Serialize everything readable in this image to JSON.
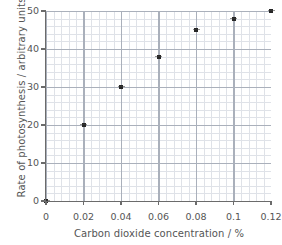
{
  "chart_data": {
    "type": "scatter",
    "title": "",
    "xlabel": "Carbon dioxide concentration / %",
    "ylabel": "Rate of photosynthesis / arbitrary units",
    "xlim": [
      0,
      0.12
    ],
    "ylim": [
      0,
      50
    ],
    "xticks": [
      "0",
      "0.02",
      "0.04",
      "0.06",
      "0.08",
      "0.1",
      "0.12"
    ],
    "xtick_values": [
      0,
      0.02,
      0.04,
      0.06,
      0.08,
      0.1,
      0.12
    ],
    "yticks": [
      "0",
      "10",
      "20",
      "30",
      "40",
      "50"
    ],
    "ytick_values": [
      0,
      10,
      20,
      30,
      40,
      50
    ],
    "grid": true,
    "grid_minor": true,
    "legend": "none",
    "marker": "square-cross",
    "marker_color": "#262626",
    "grid_major_color": "#aab0bb",
    "grid_minor_color": "#dfe2e8",
    "axis_color": "#6b6b6b",
    "text_color": "#555555",
    "x": [
      0,
      0.02,
      0.04,
      0.06,
      0.08,
      0.1,
      0.12
    ],
    "values": [
      0,
      20,
      30,
      38,
      45,
      48,
      50
    ],
    "points": [
      {
        "x": 0,
        "y": 0
      },
      {
        "x": 0.02,
        "y": 20
      },
      {
        "x": 0.04,
        "y": 30
      },
      {
        "x": 0.06,
        "y": 38
      },
      {
        "x": 0.08,
        "y": 45
      },
      {
        "x": 0.1,
        "y": 48
      },
      {
        "x": 0.12,
        "y": 50
      }
    ]
  }
}
